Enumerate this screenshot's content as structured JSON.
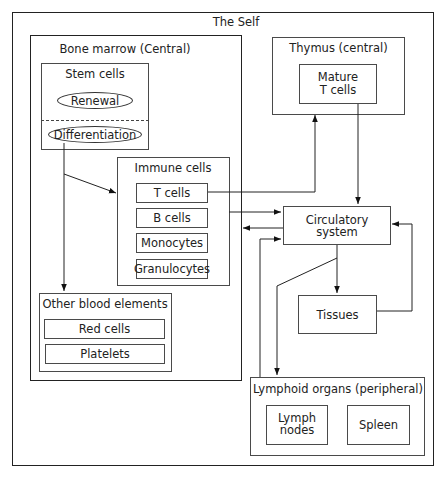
{
  "diagram": {
    "outer": {
      "title": "The Self"
    },
    "bone_marrow": {
      "title": "Bone marrow (Central)",
      "stem_cells": {
        "title": "Stem cells",
        "renewal": "Renewal",
        "differentiation": "Differentiation"
      },
      "immune_cells": {
        "title": "Immune cells",
        "items": [
          "T cells",
          "B cells",
          "Monocytes",
          "Granulocytes"
        ]
      },
      "other_blood": {
        "title": "Other blood elements",
        "items": [
          "Red cells",
          "Platelets"
        ]
      }
    },
    "thymus": {
      "title": "Thymus (central)",
      "mature_line1": "Mature",
      "mature_line2": "T cells"
    },
    "circulatory": {
      "label": "Circulatory system"
    },
    "tissues": {
      "label": "Tissues"
    },
    "lymphoid": {
      "title": "Lymphoid organs (peripheral)",
      "lymph_line1": "Lymph",
      "lymph_line2": "nodes",
      "spleen": "Spleen"
    },
    "colors": {
      "line": "#222222",
      "background": "#ffffff"
    }
  }
}
